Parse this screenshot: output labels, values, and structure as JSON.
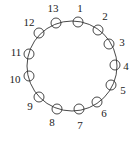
{
  "diagram": {
    "type": "circular-arrangement",
    "ring": {
      "cx": 72,
      "cy": 66,
      "r": 45
    },
    "node_radius": 5,
    "nodes": [
      {
        "label": "1",
        "cx": 78,
        "cy": 22,
        "lx": 80,
        "ly": 9
      },
      {
        "label": "2",
        "cx": 98,
        "cy": 30,
        "lx": 105,
        "ly": 17
      },
      {
        "label": "3",
        "cx": 109,
        "cy": 44,
        "lx": 122,
        "ly": 43
      },
      {
        "label": "4",
        "cx": 115,
        "cy": 65,
        "lx": 126,
        "ly": 67
      },
      {
        "label": "5",
        "cx": 111,
        "cy": 85,
        "lx": 123,
        "ly": 91
      },
      {
        "label": "6",
        "cx": 97,
        "cy": 102,
        "lx": 104,
        "ly": 114
      },
      {
        "label": "7",
        "cx": 79,
        "cy": 109,
        "lx": 80,
        "ly": 126
      },
      {
        "label": "8",
        "cx": 57,
        "cy": 109,
        "lx": 52,
        "ly": 123
      },
      {
        "label": "9",
        "cx": 39,
        "cy": 97,
        "lx": 30,
        "ly": 107
      },
      {
        "label": "10",
        "cx": 29,
        "cy": 76,
        "lx": 15,
        "ly": 80
      },
      {
        "label": "11",
        "cx": 29,
        "cy": 54,
        "lx": 16,
        "ly": 53
      },
      {
        "label": "12",
        "cx": 39,
        "cy": 33,
        "lx": 29,
        "ly": 23
      },
      {
        "label": "13",
        "cx": 56,
        "cy": 23,
        "lx": 53,
        "ly": 9
      }
    ]
  }
}
